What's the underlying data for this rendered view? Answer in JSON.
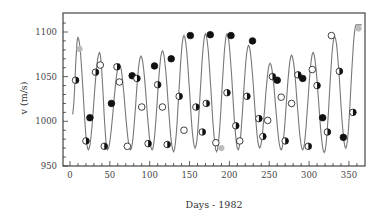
{
  "chart_data": {
    "type": "line",
    "title": "",
    "xlabel": "Days - 1982",
    "ylabel": "v  (m/s)",
    "xlim": [
      -8,
      370
    ],
    "ylim": [
      950,
      1120
    ],
    "xticks": [
      0,
      50,
      100,
      150,
      200,
      250,
      300,
      350
    ],
    "yticks": [
      950,
      1000,
      1050,
      1100
    ],
    "grid": false,
    "legend": null,
    "series": [
      {
        "name": "model curve",
        "kind": "line",
        "color": "#777777",
        "period_days": 27,
        "note": "quasi-sinusoidal radial-velocity curve, amplitude ~50-65 m/s about ~1030 m/s",
        "x": [
          3,
          10,
          23,
          37,
          47,
          62,
          76,
          89,
          103,
          116,
          130,
          143,
          157,
          170,
          184,
          197,
          211,
          224,
          238,
          251,
          265,
          278,
          292,
          305,
          319,
          332,
          346,
          359,
          366
        ],
        "y": [
          1008,
          1094,
          968,
          1077,
          968,
          1064,
          968,
          1073,
          968,
          1079,
          966,
          1096,
          970,
          1098,
          966,
          1098,
          968,
          1085,
          970,
          1065,
          968,
          1074,
          968,
          1077,
          965,
          1095,
          970,
          1108,
          1108
        ]
      },
      {
        "name": "observations",
        "kind": "scatter",
        "points": [
          {
            "x": 7,
            "y": 1046,
            "style": "half"
          },
          {
            "x": 12,
            "y": 1081,
            "style": "gray"
          },
          {
            "x": 20,
            "y": 978,
            "style": "half"
          },
          {
            "x": 25,
            "y": 1004,
            "style": "filled"
          },
          {
            "x": 32,
            "y": 1055,
            "style": "half"
          },
          {
            "x": 38,
            "y": 1063,
            "style": "open"
          },
          {
            "x": 43,
            "y": 972,
            "style": "half"
          },
          {
            "x": 52,
            "y": 1020,
            "style": "filled"
          },
          {
            "x": 59,
            "y": 1061,
            "style": "half"
          },
          {
            "x": 62,
            "y": 1044,
            "style": "open"
          },
          {
            "x": 72,
            "y": 972,
            "style": "open"
          },
          {
            "x": 78,
            "y": 1051,
            "style": "filled"
          },
          {
            "x": 84,
            "y": 1048,
            "style": "half"
          },
          {
            "x": 90,
            "y": 1016,
            "style": "open"
          },
          {
            "x": 98,
            "y": 975,
            "style": "half"
          },
          {
            "x": 106,
            "y": 1062,
            "style": "filled"
          },
          {
            "x": 110,
            "y": 1041,
            "style": "half"
          },
          {
            "x": 116,
            "y": 1016,
            "style": "open"
          },
          {
            "x": 122,
            "y": 974,
            "style": "half"
          },
          {
            "x": 127,
            "y": 1070,
            "style": "filled"
          },
          {
            "x": 137,
            "y": 1028,
            "style": "half"
          },
          {
            "x": 143,
            "y": 990,
            "style": "open"
          },
          {
            "x": 151,
            "y": 1096,
            "style": "filled"
          },
          {
            "x": 158,
            "y": 1016,
            "style": "half"
          },
          {
            "x": 166,
            "y": 988,
            "style": "half"
          },
          {
            "x": 171,
            "y": 1020,
            "style": "half"
          },
          {
            "x": 176,
            "y": 1097,
            "style": "filled"
          },
          {
            "x": 183,
            "y": 976,
            "style": "open"
          },
          {
            "x": 190,
            "y": 970,
            "style": "gray"
          },
          {
            "x": 197,
            "y": 1032,
            "style": "half"
          },
          {
            "x": 202,
            "y": 1096,
            "style": "filled"
          },
          {
            "x": 208,
            "y": 995,
            "style": "half"
          },
          {
            "x": 213,
            "y": 978,
            "style": "open"
          },
          {
            "x": 222,
            "y": 1028,
            "style": "half"
          },
          {
            "x": 229,
            "y": 1090,
            "style": "filled"
          },
          {
            "x": 237,
            "y": 1003,
            "style": "half"
          },
          {
            "x": 242,
            "y": 983,
            "style": "half"
          },
          {
            "x": 248,
            "y": 1001,
            "style": "open"
          },
          {
            "x": 254,
            "y": 1050,
            "style": "half"
          },
          {
            "x": 260,
            "y": 1046,
            "style": "filled"
          },
          {
            "x": 265,
            "y": 1027,
            "style": "open"
          },
          {
            "x": 270,
            "y": 978,
            "style": "half"
          },
          {
            "x": 278,
            "y": 1020,
            "style": "open"
          },
          {
            "x": 286,
            "y": 1052,
            "style": "half"
          },
          {
            "x": 292,
            "y": 1048,
            "style": "filled"
          },
          {
            "x": 299,
            "y": 972,
            "style": "half"
          },
          {
            "x": 304,
            "y": 1058,
            "style": "open"
          },
          {
            "x": 310,
            "y": 1040,
            "style": "half"
          },
          {
            "x": 317,
            "y": 1004,
            "style": "filled"
          },
          {
            "x": 323,
            "y": 988,
            "style": "half"
          },
          {
            "x": 328,
            "y": 1096,
            "style": "open"
          },
          {
            "x": 338,
            "y": 1056,
            "style": "half"
          },
          {
            "x": 343,
            "y": 982,
            "style": "filled"
          },
          {
            "x": 355,
            "y": 1010,
            "style": "half"
          },
          {
            "x": 362,
            "y": 1104,
            "style": "gray"
          }
        ]
      }
    ]
  },
  "axes": {
    "xlabel": "Days - 1982",
    "ylabel": "v  (m/s)",
    "xtick_labels": [
      "0",
      "50",
      "100",
      "150",
      "200",
      "250",
      "300",
      "350"
    ],
    "ytick_labels": [
      "950",
      "1000",
      "1050",
      "1100"
    ]
  },
  "colors": {
    "frame": "#333333",
    "curve": "#777777",
    "marker_dark": "#111111",
    "marker_gray": "#bbbbbb",
    "text": "#444444"
  }
}
